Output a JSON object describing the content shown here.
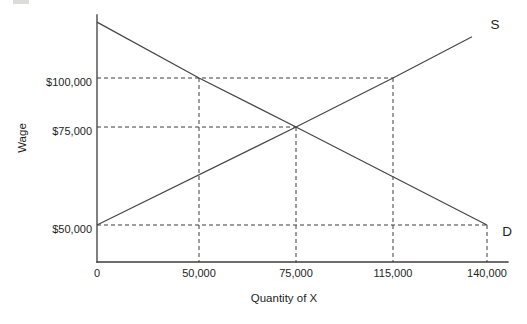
{
  "chart_data": {
    "type": "line",
    "title": "",
    "xlabel": "Quantity of X",
    "ylabel": "Wage",
    "grid": false,
    "legend": "curve labels at line ends",
    "axis_scale_note": "schematic textbook diagram; labeled ticks are evenly spaced, not to numeric scale",
    "xlim": [
      0,
      150000
    ],
    "ylim": [
      40000,
      130000
    ],
    "x_ticks": [
      {
        "value": 0,
        "label": "0"
      },
      {
        "value": 50000,
        "label": "50,000"
      },
      {
        "value": 75000,
        "label": "75,000"
      },
      {
        "value": 115000,
        "label": "115,000"
      },
      {
        "value": 140000,
        "label": "140,000"
      }
    ],
    "y_ticks": [
      {
        "value": 50000,
        "label": "$50,000"
      },
      {
        "value": 75000,
        "label": "$75,000"
      },
      {
        "value": 100000,
        "label": "$100,000"
      }
    ],
    "series": [
      {
        "name": "supply",
        "label": "S",
        "points": [
          [
            0,
            50000
          ],
          [
            75000,
            75000
          ],
          [
            115000,
            100000
          ],
          [
            136000,
            121000
          ]
        ]
      },
      {
        "name": "demand",
        "label": "D",
        "points": [
          [
            0,
            128500
          ],
          [
            50000,
            100000
          ],
          [
            75000,
            75000
          ],
          [
            140000,
            50000
          ]
        ]
      }
    ],
    "equilibrium": {
      "quantity": 75000,
      "wage": 75000
    },
    "key_points": [
      {
        "quantity": 50000,
        "wage": 100000,
        "on": "demand"
      },
      {
        "quantity": 75000,
        "wage": 75000,
        "on": "equilibrium"
      },
      {
        "quantity": 115000,
        "wage": 100000,
        "on": "supply"
      },
      {
        "quantity": 140000,
        "wage": 50000,
        "on": "demand"
      }
    ],
    "guides": {
      "horizontal": [
        {
          "y": 100000,
          "to_x": 115000
        },
        {
          "y": 75000,
          "to_x": 75000
        },
        {
          "y": 50000,
          "to_x": 140000
        }
      ],
      "vertical": [
        {
          "x": 50000,
          "from_y": 100000
        },
        {
          "x": 75000,
          "from_y": 75000
        },
        {
          "x": 115000,
          "from_y": 100000
        },
        {
          "x": 140000,
          "from_y": 50000
        }
      ]
    },
    "colors": {
      "line": "#3c3c3c",
      "text": "#1e1e1e",
      "background": "#ffffff"
    }
  }
}
